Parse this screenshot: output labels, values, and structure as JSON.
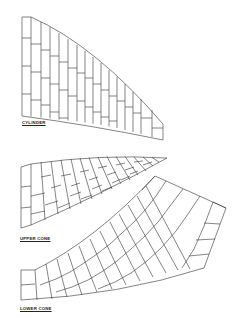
{
  "figure": {
    "line_color": "#333333",
    "background": "#ffffff"
  },
  "panels": [
    {
      "id": "cylinder",
      "label": "CYLINDER"
    },
    {
      "id": "upper-cone",
      "label": "UPPER CONE"
    },
    {
      "id": "lower-cone",
      "label": "LOWER CONE"
    }
  ]
}
